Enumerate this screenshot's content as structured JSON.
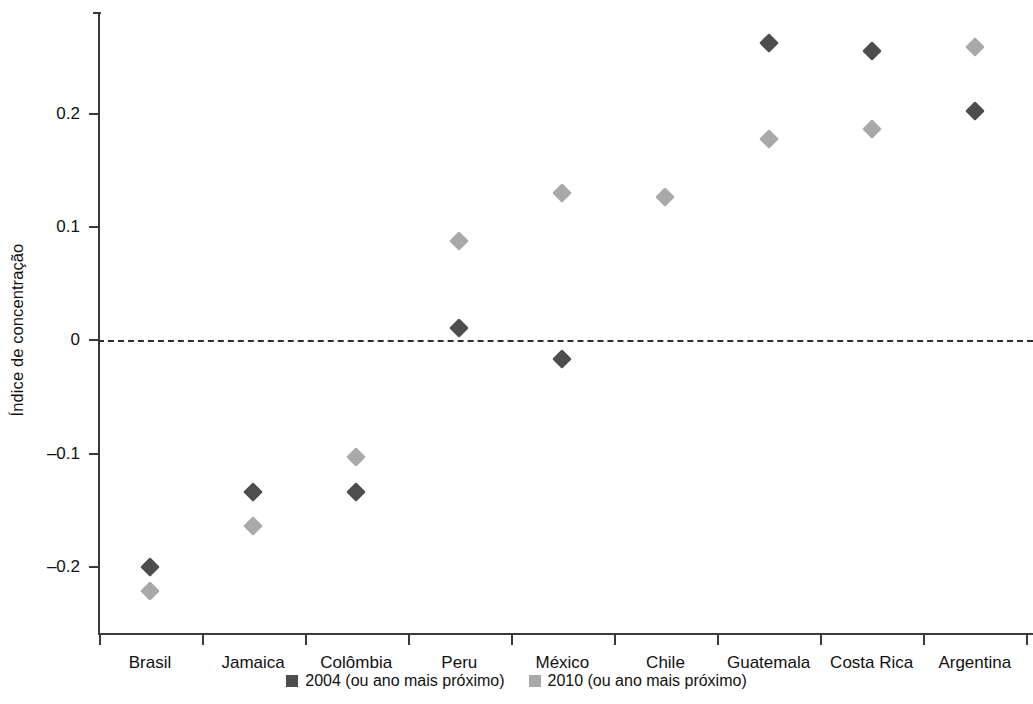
{
  "chart_data": {
    "type": "scatter",
    "title": "",
    "xlabel": "",
    "ylabel": "Índice de concentração",
    "ylim": [
      -0.26,
      0.29
    ],
    "yticks": [
      0.2,
      0.1,
      0,
      -0.1,
      -0.2
    ],
    "ytick_labels": [
      "0.2",
      "0.1",
      "0",
      "–0.1",
      "–0.2"
    ],
    "grid": false,
    "zero_reference_line": 0,
    "legend_position": "bottom-center",
    "categories": [
      "Brasil",
      "Jamaica",
      "Colômbia",
      "Peru",
      "México",
      "Chile",
      "Guatemala",
      "Costa Rica",
      "Argentina"
    ],
    "series": [
      {
        "name": "2004 (ou ano mais próximo)",
        "color": "#4d4d4d",
        "marker": "diamond",
        "values": [
          -0.2,
          -0.134,
          -0.134,
          0.011,
          -0.016,
          null,
          0.263,
          0.256,
          0.203
        ]
      },
      {
        "name": "2010 (ou ano mais próximo)",
        "color": "#a9a9a9",
        "marker": "diamond",
        "values": [
          -0.221,
          -0.164,
          -0.103,
          0.088,
          0.13,
          0.127,
          0.178,
          0.187,
          0.259
        ]
      }
    ]
  },
  "axis": {
    "y_title": "Índice de concentração"
  },
  "legend": {
    "entries": [
      {
        "label": "2004 (ou ano mais próximo)",
        "color": "#4d4d4d"
      },
      {
        "label": "2010 (ou ano mais próximo)",
        "color": "#a9a9a9"
      }
    ]
  }
}
